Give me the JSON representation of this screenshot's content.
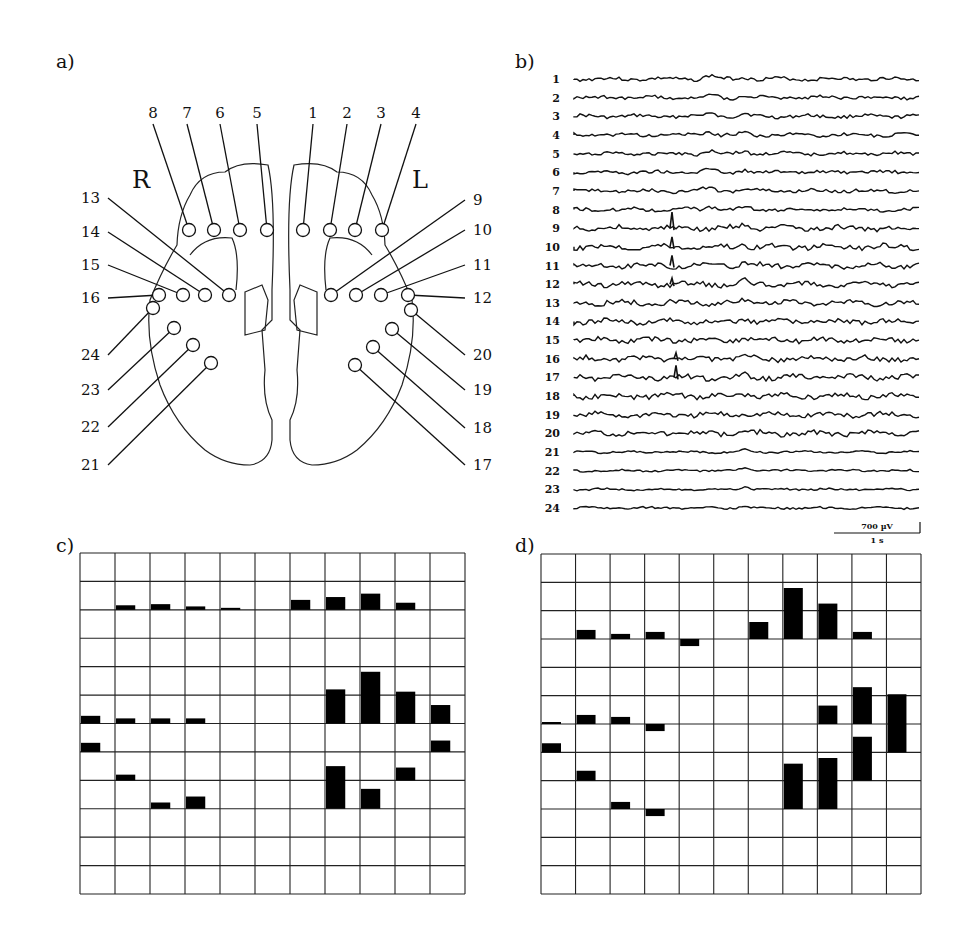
{
  "figure": {
    "panels": [
      {
        "id": "a",
        "label": "a)"
      },
      {
        "id": "b",
        "label": "b)"
      },
      {
        "id": "c",
        "label": "c)"
      },
      {
        "id": "d",
        "label": "d)"
      }
    ]
  },
  "panel_a": {
    "hemisphere_labels": {
      "right": "R",
      "left": "L"
    },
    "electrodes": [
      {
        "n": "1",
        "cx": 303,
        "cy": 230,
        "lx": 313,
        "ly": 118,
        "side": "top"
      },
      {
        "n": "2",
        "cx": 330,
        "cy": 230,
        "lx": 347,
        "ly": 118,
        "side": "top"
      },
      {
        "n": "3",
        "cx": 355,
        "cy": 230,
        "lx": 381,
        "ly": 118,
        "side": "top"
      },
      {
        "n": "4",
        "cx": 382,
        "cy": 230,
        "lx": 416,
        "ly": 118,
        "side": "top"
      },
      {
        "n": "5",
        "cx": 267,
        "cy": 230,
        "lx": 257,
        "ly": 118,
        "side": "top"
      },
      {
        "n": "6",
        "cx": 240,
        "cy": 230,
        "lx": 220,
        "ly": 118,
        "side": "top"
      },
      {
        "n": "7",
        "cx": 214,
        "cy": 230,
        "lx": 187,
        "ly": 118,
        "side": "top"
      },
      {
        "n": "8",
        "cx": 189,
        "cy": 230,
        "lx": 153,
        "ly": 118,
        "side": "top"
      },
      {
        "n": "9",
        "cx": 331,
        "cy": 295,
        "lx": 465,
        "ly": 200,
        "side": "right"
      },
      {
        "n": "10",
        "cx": 356,
        "cy": 295,
        "lx": 465,
        "ly": 230,
        "side": "right"
      },
      {
        "n": "11",
        "cx": 381,
        "cy": 295,
        "lx": 465,
        "ly": 265,
        "side": "right"
      },
      {
        "n": "12",
        "cx": 408,
        "cy": 295,
        "lx": 465,
        "ly": 298,
        "side": "right"
      },
      {
        "n": "13",
        "cx": 229,
        "cy": 295,
        "lx": 108,
        "ly": 198,
        "side": "left"
      },
      {
        "n": "14",
        "cx": 205,
        "cy": 295,
        "lx": 108,
        "ly": 232,
        "side": "left"
      },
      {
        "n": "15",
        "cx": 183,
        "cy": 295,
        "lx": 108,
        "ly": 265,
        "side": "left"
      },
      {
        "n": "16",
        "cx": 159,
        "cy": 295,
        "lx": 108,
        "ly": 298,
        "side": "left"
      },
      {
        "n": "17",
        "cx": 355,
        "cy": 365,
        "lx": 465,
        "ly": 465,
        "side": "right"
      },
      {
        "n": "18",
        "cx": 373,
        "cy": 347,
        "lx": 465,
        "ly": 428,
        "side": "right"
      },
      {
        "n": "19",
        "cx": 392,
        "cy": 329,
        "lx": 465,
        "ly": 390,
        "side": "right"
      },
      {
        "n": "20",
        "cx": 411,
        "cy": 310,
        "lx": 465,
        "ly": 355,
        "side": "right"
      },
      {
        "n": "21",
        "cx": 211,
        "cy": 363,
        "lx": 108,
        "ly": 465,
        "side": "left"
      },
      {
        "n": "22",
        "cx": 193,
        "cy": 345,
        "lx": 108,
        "ly": 427,
        "side": "left"
      },
      {
        "n": "23",
        "cx": 174,
        "cy": 328,
        "lx": 108,
        "ly": 390,
        "side": "left"
      },
      {
        "n": "24",
        "cx": 153,
        "cy": 308,
        "lx": 108,
        "ly": 355,
        "side": "left"
      }
    ]
  },
  "panel_b": {
    "channels": [
      "1",
      "2",
      "3",
      "4",
      "5",
      "6",
      "7",
      "8",
      "9",
      "10",
      "11",
      "12",
      "13",
      "14",
      "15",
      "16",
      "17",
      "18",
      "19",
      "20",
      "21",
      "22",
      "23",
      "24"
    ],
    "spike_channels": [
      "9",
      "10",
      "11",
      "12",
      "16",
      "17"
    ],
    "scale_bar": {
      "amplitude": "700 µV",
      "time": "1 s"
    }
  },
  "panel_c": {
    "grid": {
      "cols": 11,
      "rows": 12,
      "x": 80,
      "y": 553,
      "w": 385,
      "h": 341
    },
    "bars": [
      {
        "col": 1,
        "row": 2,
        "h": 0.16
      },
      {
        "col": 2,
        "row": 2,
        "h": 0.2
      },
      {
        "col": 3,
        "row": 2,
        "h": 0.12
      },
      {
        "col": 4,
        "row": 2,
        "h": 0.07
      },
      {
        "col": 6,
        "row": 2,
        "h": 0.35
      },
      {
        "col": 7,
        "row": 2,
        "h": 0.45
      },
      {
        "col": 8,
        "row": 2,
        "h": 0.57
      },
      {
        "col": 9,
        "row": 2,
        "h": 0.25
      },
      {
        "col": 7,
        "row": 6,
        "h": 1.2
      },
      {
        "col": 8,
        "row": 6,
        "h": 1.82
      },
      {
        "col": 9,
        "row": 6,
        "h": 1.12
      },
      {
        "col": 10,
        "row": 6,
        "h": 0.65
      },
      {
        "col": 0,
        "row": 6,
        "h": 0.27
      },
      {
        "col": 1,
        "row": 6,
        "h": 0.18
      },
      {
        "col": 2,
        "row": 6,
        "h": 0.18
      },
      {
        "col": 3,
        "row": 6,
        "h": 0.18
      },
      {
        "col": 0,
        "row": 7,
        "h": 0.32
      },
      {
        "col": 10,
        "row": 7,
        "h": 0.4
      },
      {
        "col": 1,
        "row": 8,
        "h": 0.2
      },
      {
        "col": 9,
        "row": 8,
        "h": 0.45
      },
      {
        "col": 7,
        "row": 9,
        "h": 1.5
      },
      {
        "col": 8,
        "row": 9,
        "h": 0.7
      },
      {
        "col": 2,
        "row": 9,
        "h": 0.22
      },
      {
        "col": 3,
        "row": 9,
        "h": 0.43
      }
    ]
  },
  "panel_d": {
    "grid": {
      "cols": 11,
      "rows": 12,
      "x": 541,
      "y": 554,
      "w": 380,
      "h": 340
    },
    "bars": [
      {
        "col": 1,
        "row": 3,
        "h": 0.32
      },
      {
        "col": 2,
        "row": 3,
        "h": 0.18
      },
      {
        "col": 3,
        "row": 3,
        "h": 0.25
      },
      {
        "col": 4,
        "row": 3,
        "h": -0.25
      },
      {
        "col": 6,
        "row": 3,
        "h": 0.6
      },
      {
        "col": 7,
        "row": 3,
        "h": 1.8
      },
      {
        "col": 8,
        "row": 3,
        "h": 1.25
      },
      {
        "col": 9,
        "row": 3,
        "h": 0.25
      },
      {
        "col": 0,
        "row": 6,
        "h": 0.07
      },
      {
        "col": 1,
        "row": 6,
        "h": 0.32
      },
      {
        "col": 2,
        "row": 6,
        "h": 0.25
      },
      {
        "col": 3,
        "row": 6,
        "h": -0.25
      },
      {
        "col": 8,
        "row": 6,
        "h": 0.65
      },
      {
        "col": 9,
        "row": 6,
        "h": 1.3
      },
      {
        "col": 10,
        "row": 7,
        "h": 2.05
      },
      {
        "col": 0,
        "row": 7,
        "h": 0.32
      },
      {
        "col": 9,
        "row": 8,
        "h": 1.55
      },
      {
        "col": 1,
        "row": 8,
        "h": 0.35
      },
      {
        "col": 7,
        "row": 9,
        "h": 1.6
      },
      {
        "col": 8,
        "row": 9,
        "h": 1.8
      },
      {
        "col": 2,
        "row": 9,
        "h": 0.25
      },
      {
        "col": 3,
        "row": 9,
        "h": -0.25
      }
    ]
  }
}
